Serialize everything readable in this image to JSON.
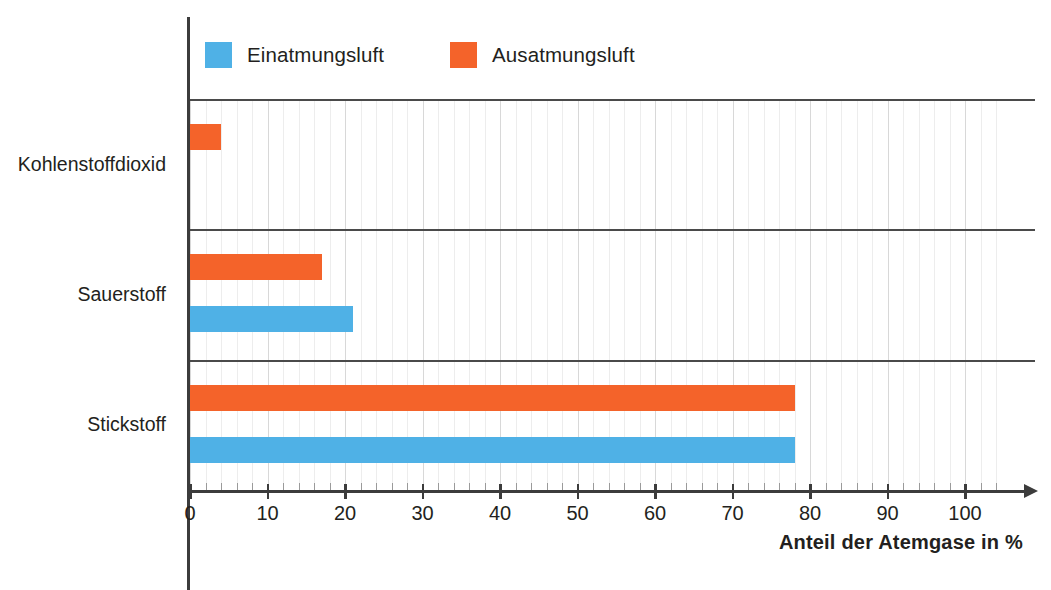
{
  "chart_data": {
    "type": "bar",
    "orientation": "horizontal",
    "title": "",
    "xlabel": "Anteil der Atemgase in %",
    "ylabel": "",
    "xlim": [
      0,
      105
    ],
    "xticks": [
      0,
      10,
      20,
      30,
      40,
      50,
      60,
      70,
      80,
      90,
      100
    ],
    "xtick_labels": [
      "0",
      "10",
      "20",
      "30",
      "40",
      "50",
      "60",
      "70",
      "80",
      "90",
      "100"
    ],
    "grid": true,
    "legend_position": "top-left",
    "categories": [
      "Stickstoff",
      "Sauerstoff",
      "Kohlenstoffdioxid"
    ],
    "series": [
      {
        "name": "Einatmungsluft",
        "color": "#4fb1e6",
        "values": [
          78,
          21,
          0
        ]
      },
      {
        "name": "Ausatmungsluft",
        "color": "#f4632a",
        "values": [
          78,
          17,
          4
        ]
      }
    ]
  },
  "legend": {
    "entries": [
      {
        "label": "Einatmungsluft",
        "color": "#4fb1e6"
      },
      {
        "label": "Ausatmungsluft",
        "color": "#f4632a"
      }
    ]
  },
  "axis": {
    "x_title": "Anteil der Atemgase in %",
    "ticks": [
      "0",
      "10",
      "20",
      "30",
      "40",
      "50",
      "60",
      "70",
      "80",
      "90",
      "100"
    ]
  },
  "categories": {
    "co2": "Kohlenstoffdioxid",
    "o2": "Sauerstoff",
    "n2": "Stickstoff"
  },
  "colors": {
    "inhale": "#4fb1e6",
    "exhale": "#f4632a",
    "axis": "#3c3c3c",
    "grid": "#d8d8d8",
    "text": "#231f20",
    "background": "#ffffff"
  }
}
